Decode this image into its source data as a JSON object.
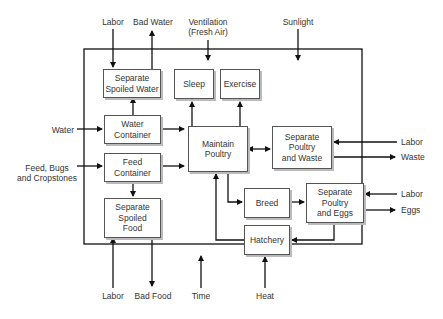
{
  "diagram": {
    "type": "process flow diagram",
    "boxes": {
      "separate_spoiled_water": "Separate\nSpoiled Water",
      "sleep": "Sleep",
      "exercise": "Exercise",
      "water_container": "Water\nContainer",
      "feed_container": "Feed\nContainer",
      "maintain_poultry": "Maintain\nPoultry",
      "separate_poultry_waste": "Separate\nPoultry\nand Waste",
      "separate_spoiled_food": "Separate\nSpoiled\nFood",
      "breed": "Breed",
      "separate_poultry_eggs": "Separate\nPoultry\nand Eggs",
      "hatchery": "Hatchery"
    },
    "inputs_outputs": {
      "top_labor": "Labor",
      "top_bad_water": "Bad Water",
      "ventilation": "Ventilation\n(Fresh Air)",
      "sunlight": "Sunlight",
      "water": "Water",
      "feed": "Feed, Bugs\nand Cropstones",
      "labor_waste": "Labor",
      "waste": "Waste",
      "labor_eggs": "Labor",
      "eggs": "Eggs",
      "bottom_labor": "Labor",
      "bad_food": "Bad Food",
      "time": "Time",
      "heat": "Heat"
    }
  }
}
